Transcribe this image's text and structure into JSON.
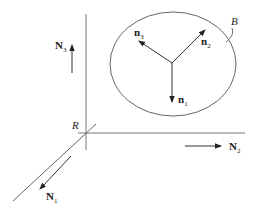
{
  "diagram": {
    "colors": {
      "line": "#555555",
      "text": "#222222",
      "background": "#ffffff"
    },
    "frame_R": {
      "origin_label": "R",
      "axes": [
        {
          "name": "N1",
          "base": "N",
          "sub": "1",
          "direction": "out-of-page (down-left)"
        },
        {
          "name": "N2",
          "base": "N",
          "sub": "2",
          "direction": "right"
        },
        {
          "name": "N3",
          "base": "N",
          "sub": "3",
          "direction": "up"
        }
      ]
    },
    "body_B": {
      "label": "B",
      "vectors": [
        {
          "name": "n1",
          "base": "n",
          "sub": "1",
          "direction": "down"
        },
        {
          "name": "n2",
          "base": "n",
          "sub": "2",
          "direction": "up-right"
        },
        {
          "name": "n3",
          "base": "n",
          "sub": "3",
          "direction": "up-left"
        }
      ]
    }
  }
}
